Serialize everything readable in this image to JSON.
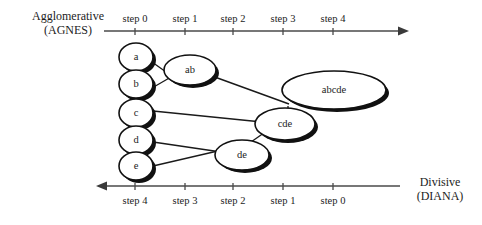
{
  "figure": {
    "title_top_line1": "Agglomerative",
    "title_top_line2": "(AGNES)",
    "title_bottom_line1": "Divisive",
    "title_bottom_line2": "(DIANA)"
  },
  "top_axis": {
    "direction": "left-to-right",
    "labels": [
      "step 0",
      "step 1",
      "step 2",
      "step 3",
      "step 4"
    ],
    "tick_x": [
      135,
      185,
      233,
      283,
      333
    ],
    "line_y": 31,
    "line_x1": 104,
    "line_x2": 405
  },
  "bottom_axis": {
    "direction": "right-to-left",
    "labels": [
      "step 4",
      "step 3",
      "step 2",
      "step 1",
      "step 0"
    ],
    "tick_x": [
      135,
      185,
      233,
      283,
      333
    ],
    "line_y": 186,
    "line_x1": 100,
    "line_x2": 400
  },
  "nodes": [
    {
      "id": "a",
      "label": "a",
      "cx": 136,
      "cy": 57,
      "rx": 17,
      "ry": 14
    },
    {
      "id": "b",
      "label": "b",
      "cx": 136,
      "cy": 84,
      "rx": 17,
      "ry": 14
    },
    {
      "id": "c",
      "label": "c",
      "cx": 136,
      "cy": 113,
      "rx": 17,
      "ry": 14
    },
    {
      "id": "d",
      "label": "d",
      "cx": 136,
      "cy": 140,
      "rx": 17,
      "ry": 14
    },
    {
      "id": "e",
      "label": "e",
      "cx": 136,
      "cy": 166,
      "rx": 17,
      "ry": 14
    },
    {
      "id": "ab",
      "label": "ab",
      "cx": 190,
      "cy": 70,
      "rx": 26,
      "ry": 15
    },
    {
      "id": "de",
      "label": "de",
      "cx": 242,
      "cy": 155,
      "rx": 27,
      "ry": 15
    },
    {
      "id": "cde",
      "label": "cde",
      "cx": 285,
      "cy": 124,
      "rx": 30,
      "ry": 16
    },
    {
      "id": "abcde",
      "label": "abcde",
      "cx": 334,
      "cy": 90,
      "rx": 52,
      "ry": 19
    }
  ],
  "links": [
    {
      "from": "a",
      "to": "ab",
      "x1": 152,
      "y1": 62,
      "x2": 172,
      "y2": 77
    },
    {
      "from": "b",
      "to": "ab",
      "x1": 152,
      "y1": 88,
      "x2": 170,
      "y2": 76
    },
    {
      "from": "ab",
      "to": "abcde",
      "x1": 212,
      "y1": 76,
      "x2": 288,
      "y2": 103
    },
    {
      "from": "c",
      "to": "cde",
      "x1": 153,
      "y1": 111,
      "x2": 262,
      "y2": 122
    },
    {
      "from": "d",
      "to": "de",
      "x1": 153,
      "y1": 142,
      "x2": 221,
      "y2": 152
    },
    {
      "from": "e",
      "to": "de",
      "x1": 153,
      "y1": 166,
      "x2": 222,
      "y2": 150
    },
    {
      "from": "de",
      "to": "cde",
      "x1": 250,
      "y1": 141,
      "x2": 270,
      "y2": 127
    },
    {
      "from": "cde",
      "to": "abcde",
      "x1": 288,
      "y1": 108,
      "x2": 288,
      "y2": 128
    }
  ]
}
